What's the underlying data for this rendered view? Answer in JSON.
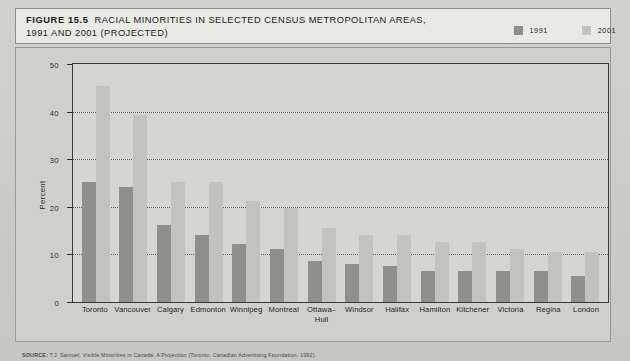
{
  "figure": {
    "label": "FIGURE 15.5",
    "title_line1": "RACIAL MINORITIES IN SELECTED CENSUS METROPOLITAN AREAS,",
    "title_line2": "1991 AND 2001 (PROJECTED)"
  },
  "legend": {
    "position": "top-right",
    "items": [
      {
        "label": "1991",
        "color": "#8f8f8b",
        "icon": "square-swatch-icon"
      },
      {
        "label": "2001",
        "color": "#c2c2be",
        "icon": "square-swatch-icon"
      }
    ]
  },
  "source": {
    "prefix": "SOURCE:",
    "text": "T.J. Samuel, Visible Minorities in Canada: A Projection (Toronto: Canadian Advertising Foundation, 1992)."
  },
  "chart_data": {
    "type": "bar",
    "title": "RACIAL MINORITIES IN SELECTED CENSUS METROPOLITAN AREAS, 1991 AND 2001 (PROJECTED)",
    "xlabel": "",
    "ylabel": "Percent",
    "ylim": [
      0,
      50
    ],
    "yticks": [
      0,
      10,
      20,
      30,
      40,
      50
    ],
    "grid": true,
    "categories": [
      "Toronto",
      "Vancouver",
      "Calgary",
      "Edmonton",
      "Winnipeg",
      "Montreal",
      "Ottawa–\nHull",
      "Windsor",
      "Halifax",
      "Hamilton",
      "Kitchener",
      "Victoria",
      "Regina",
      "London"
    ],
    "series": [
      {
        "name": "1991",
        "color": "#8f8f8b",
        "values": [
          25,
          24,
          16,
          14,
          12,
          11,
          8.5,
          8,
          7.5,
          6.5,
          6.5,
          6.5,
          6.5,
          5.5
        ]
      },
      {
        "name": "2001",
        "color": "#c2c2be",
        "values": [
          45,
          39,
          25,
          25,
          21,
          19.5,
          15.5,
          14,
          14,
          12.5,
          12.5,
          11,
          10.5,
          10.5
        ]
      }
    ]
  }
}
